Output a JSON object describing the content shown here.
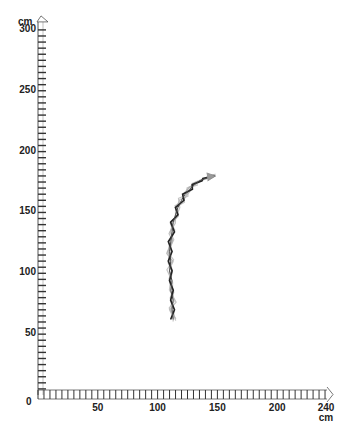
{
  "chart_data": {
    "type": "line",
    "title": "",
    "xlabel": "cm",
    "ylabel": "cm",
    "xlim": [
      0,
      240
    ],
    "ylim": [
      0,
      300
    ],
    "grid": false,
    "legend": null,
    "x_ticks": [
      0,
      50,
      100,
      150,
      200,
      240
    ],
    "y_ticks": [
      50,
      100,
      150,
      200,
      250,
      300
    ],
    "x_tick_labels": [
      "0",
      "50",
      "100",
      "150",
      "200",
      "240"
    ],
    "y_tick_labels": [
      "50",
      "100",
      "150",
      "200",
      "250",
      "300"
    ],
    "minor_tick_interval": 5,
    "series": [
      {
        "name": "track",
        "x": [
          113,
          112,
          113,
          111,
          112,
          110,
          111,
          110,
          111,
          112,
          113,
          115,
          117,
          120,
          123,
          127,
          131,
          135,
          140,
          146
        ],
        "y": [
          62,
          70,
          78,
          86,
          94,
          102,
          110,
          118,
          126,
          134,
          142,
          148,
          154,
          160,
          165,
          169,
          173,
          176,
          178,
          180
        ]
      }
    ]
  },
  "axes": {
    "y_unit": "cm",
    "x_unit": "cm",
    "origin_label": "0"
  }
}
